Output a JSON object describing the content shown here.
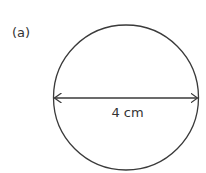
{
  "figure": {
    "part_label": "(a)",
    "shape": "circle",
    "measurement": {
      "type": "diameter",
      "label": "4 cm",
      "value": 4,
      "unit": "cm"
    },
    "colors": {
      "stroke": "#3a3a3a",
      "text": "#333333",
      "background": "#ffffff"
    }
  }
}
